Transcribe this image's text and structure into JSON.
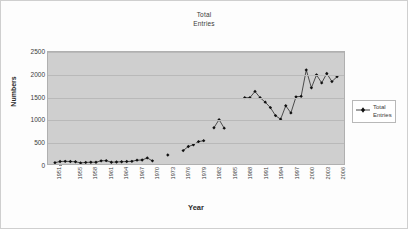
{
  "chart_data": {
    "type": "scatter",
    "title": "Total Entries",
    "title_line1": "Total",
    "title_line2": "Entries",
    "xlabel": "Year",
    "ylabel": "Numbers",
    "ylim": [
      0,
      2500
    ],
    "ytick_values": [
      0,
      500,
      1000,
      1500,
      2000,
      2500
    ],
    "ytick_labels": [
      "0",
      "500",
      "1000",
      "1500",
      "2000",
      "2500"
    ],
    "xlim": [
      1951,
      2006
    ],
    "xtick_labels": [
      "1951",
      "1955",
      "1958",
      "1961",
      "1964",
      "1967",
      "1970",
      "1973",
      "1976",
      "1979",
      "1982",
      "1985",
      "1988",
      "1991",
      "1994",
      "1997",
      "2000",
      "2003",
      "2006"
    ],
    "xtick_years": [
      1951,
      1955,
      1958,
      1961,
      1964,
      1967,
      1970,
      1973,
      1976,
      1979,
      1982,
      1985,
      1988,
      1991,
      1994,
      1997,
      2000,
      2003,
      2006
    ],
    "grid": true,
    "legend_position": "right",
    "legend_entries": [
      "Total Entries"
    ],
    "legend_line1": "Total",
    "legend_line2": "Entries",
    "series": [
      {
        "name": "Total Entries",
        "marker": "diamond",
        "color": "#101010",
        "x": [
          1951,
          1952,
          1953,
          1954,
          1955,
          1956,
          1957,
          1958,
          1959,
          1960,
          1961,
          1962,
          1963,
          1964,
          1965,
          1966,
          1967,
          1968,
          1969,
          1970,
          1973,
          1976,
          1977,
          1978,
          1979,
          1980,
          1982,
          1983,
          1984,
          1988,
          1989,
          1990,
          1991,
          1992,
          1993,
          1994,
          1995,
          1996,
          1997,
          1998,
          1999,
          2000,
          2001,
          2002,
          2003,
          2004,
          2005,
          2006
        ],
        "values": [
          30,
          55,
          60,
          55,
          50,
          25,
          35,
          40,
          40,
          70,
          75,
          40,
          45,
          50,
          55,
          60,
          85,
          90,
          135,
          70,
          200,
          300,
          390,
          430,
          500,
          520,
          810,
          990,
          800,
          1480,
          1480,
          1620,
          1480,
          1380,
          1260,
          1080,
          1000,
          1300,
          1140,
          1500,
          1510,
          2100,
          1700,
          1990,
          1810,
          2020,
          1840,
          1950
        ]
      }
    ]
  },
  "plot_style": {
    "plot_background": "#cfcfcf",
    "gridline_color": "#b9b9b9",
    "axis_color": "#8e8e8e",
    "page_background": "#ffffff"
  }
}
